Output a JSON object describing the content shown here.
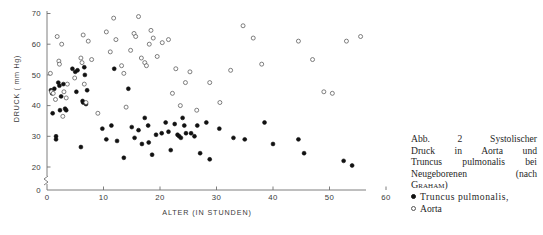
{
  "chart_data": {
    "type": "scatter",
    "title": "",
    "xlabel": "ALTER (IN STUNDEN)",
    "ylabel": "DRUCK ( mm Hg)",
    "xlim": [
      0,
      60
    ],
    "ylim": [
      0,
      70
    ],
    "y_axis_break": true,
    "y_break_note": "axis broken between 0 and 20",
    "grid": false,
    "legend_position": "right-caption",
    "xticks": [
      0,
      10,
      20,
      30,
      40,
      50,
      60
    ],
    "yticks": [
      0,
      20,
      30,
      40,
      50,
      60,
      70
    ],
    "xtick_labels": [
      "0",
      "10",
      "20",
      "30",
      "40",
      "50",
      "60"
    ],
    "ytick_labels": [
      "0",
      "20",
      "30",
      "40",
      "50",
      "60",
      "70"
    ],
    "series": [
      {
        "name": "Truncus pulmonalis",
        "marker": "filled-circle",
        "color": "#111111",
        "points": [
          [
            0.7,
            45.0
          ],
          [
            0.9,
            44.0
          ],
          [
            1.0,
            37.5
          ],
          [
            1.3,
            45.5
          ],
          [
            1.6,
            30.0
          ],
          [
            1.6,
            29.0
          ],
          [
            2.0,
            47.5
          ],
          [
            2.2,
            46.5
          ],
          [
            2.3,
            38.5
          ],
          [
            2.5,
            43.0
          ],
          [
            2.9,
            47.0
          ],
          [
            3.2,
            39.0
          ],
          [
            3.4,
            38.5
          ],
          [
            4.5,
            52.0
          ],
          [
            5.0,
            51.0
          ],
          [
            5.2,
            44.5
          ],
          [
            5.4,
            51.5
          ],
          [
            6.0,
            26.5
          ],
          [
            6.3,
            41.5
          ],
          [
            6.4,
            41.0
          ],
          [
            6.6,
            52.5
          ],
          [
            6.7,
            50.0
          ],
          [
            6.9,
            40.5
          ],
          [
            7.1,
            45.0
          ],
          [
            9.8,
            32.5
          ],
          [
            10.5,
            29.0
          ],
          [
            11.4,
            33.5
          ],
          [
            11.9,
            52.0
          ],
          [
            12.4,
            28.5
          ],
          [
            13.6,
            23.0
          ],
          [
            14.4,
            45.5
          ],
          [
            15.0,
            33.0
          ],
          [
            15.5,
            29.5
          ],
          [
            16.2,
            32.0
          ],
          [
            16.8,
            27.5
          ],
          [
            17.3,
            36.0
          ],
          [
            17.9,
            33.5
          ],
          [
            18.0,
            28.0
          ],
          [
            18.6,
            24.0
          ],
          [
            19.3,
            30.5
          ],
          [
            20.3,
            31.0
          ],
          [
            21.0,
            34.5
          ],
          [
            21.5,
            31.5
          ],
          [
            21.9,
            25.5
          ],
          [
            22.6,
            34.0
          ],
          [
            23.1,
            30.5
          ],
          [
            23.4,
            30.0
          ],
          [
            23.7,
            29.5
          ],
          [
            24.0,
            36.0
          ],
          [
            24.3,
            33.5
          ],
          [
            24.6,
            31.0
          ],
          [
            25.5,
            31.0
          ],
          [
            26.1,
            30.0
          ],
          [
            26.6,
            33.5
          ],
          [
            27.1,
            24.5
          ],
          [
            28.2,
            34.5
          ],
          [
            28.8,
            22.5
          ],
          [
            30.5,
            32.5
          ],
          [
            33.0,
            29.5
          ],
          [
            35.0,
            29.0
          ],
          [
            38.5,
            34.5
          ],
          [
            40.0,
            27.5
          ],
          [
            44.5,
            29.0
          ],
          [
            45.5,
            24.5
          ],
          [
            52.5,
            22.0
          ],
          [
            54.0,
            20.5
          ]
        ]
      },
      {
        "name": "Aorta",
        "marker": "open-circle",
        "color": "#555555",
        "points": [
          [
            0.6,
            50.5
          ],
          [
            0.8,
            44.5
          ],
          [
            1.1,
            44.0
          ],
          [
            1.5,
            42.0
          ],
          [
            1.8,
            62.5
          ],
          [
            2.1,
            54.5
          ],
          [
            2.2,
            53.5
          ],
          [
            2.6,
            60.0
          ],
          [
            2.8,
            36.5
          ],
          [
            3.0,
            44.5
          ],
          [
            3.4,
            42.5
          ],
          [
            3.6,
            47.0
          ],
          [
            4.9,
            49.0
          ],
          [
            6.0,
            55.5
          ],
          [
            6.2,
            54.0
          ],
          [
            6.4,
            63.0
          ],
          [
            6.6,
            47.0
          ],
          [
            6.9,
            41.0
          ],
          [
            7.3,
            61.0
          ],
          [
            7.9,
            55.0
          ],
          [
            9.0,
            37.5
          ],
          [
            10.5,
            64.0
          ],
          [
            11.2,
            57.5
          ],
          [
            11.8,
            68.5
          ],
          [
            12.2,
            61.5
          ],
          [
            13.2,
            53.0
          ],
          [
            13.6,
            50.5
          ],
          [
            14.0,
            39.5
          ],
          [
            14.8,
            58.0
          ],
          [
            15.4,
            63.5
          ],
          [
            15.7,
            62.5
          ],
          [
            16.2,
            69.0
          ],
          [
            16.7,
            55.5
          ],
          [
            17.3,
            54.0
          ],
          [
            17.6,
            53.0
          ],
          [
            18.1,
            60.0
          ],
          [
            18.4,
            64.5
          ],
          [
            18.8,
            62.0
          ],
          [
            19.5,
            56.0
          ],
          [
            20.4,
            60.5
          ],
          [
            21.5,
            61.5
          ],
          [
            22.2,
            44.0
          ],
          [
            22.8,
            52.0
          ],
          [
            23.6,
            40.0
          ],
          [
            24.5,
            47.5
          ],
          [
            25.3,
            51.0
          ],
          [
            26.5,
            38.5
          ],
          [
            28.8,
            47.5
          ],
          [
            30.6,
            41.0
          ],
          [
            32.5,
            51.5
          ],
          [
            34.7,
            66.0
          ],
          [
            36.5,
            62.0
          ],
          [
            38.0,
            53.5
          ],
          [
            44.5,
            61.0
          ],
          [
            47.0,
            55.0
          ],
          [
            49.0,
            44.5
          ],
          [
            50.5,
            44.0
          ],
          [
            53.0,
            61.0
          ],
          [
            55.5,
            62.5
          ]
        ]
      }
    ]
  },
  "axes": {
    "y_title": "DRUCK ( mm Hg)",
    "x_title": "ALTER (IN STUNDEN)"
  },
  "caption": {
    "line1": "Abb. 2   Systolischer",
    "line2": "Druck in Aorta und",
    "line3": "Truncus pulmonalis bei",
    "line4": "Neugeborenen  (nach",
    "line5_author": "Graham",
    "line5_tail": ")"
  },
  "legend": {
    "items": [
      {
        "marker": "filled-circle",
        "label": "Truncus pulmonalis,"
      },
      {
        "marker": "open-circle",
        "label": "Aorta"
      }
    ]
  }
}
